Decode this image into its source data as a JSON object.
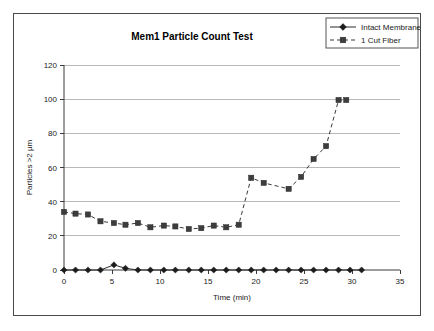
{
  "chart_data": {
    "type": "line",
    "title": "Mem1 Particle Count Test",
    "xlabel": "Time (min)",
    "ylabel": "Particles >2 µm",
    "xlim": [
      0,
      35
    ],
    "ylim": [
      0,
      120
    ],
    "xticks": [
      "0",
      "5",
      "10",
      "15",
      "20",
      "25",
      "30",
      "35"
    ],
    "yticks": [
      "0",
      "20",
      "40",
      "60",
      "80",
      "100",
      "120"
    ],
    "grid": "horizontal",
    "legend_position": "top-right",
    "series": [
      {
        "name": "Intact Membrane",
        "marker": "diamond",
        "linestyle": "solid",
        "color": "#1c1c1c",
        "x": [
          0,
          1.2,
          2.5,
          3.8,
          5.2,
          6.4,
          7.7,
          9.0,
          10.4,
          11.6,
          13.0,
          14.3,
          15.6,
          16.9,
          18.2,
          19.5,
          20.8,
          22.1,
          23.4,
          24.7,
          26.0,
          27.3,
          28.6,
          29.8,
          31.0
        ],
        "y": [
          0,
          0,
          0,
          0,
          3,
          1,
          0,
          0,
          0,
          0,
          0,
          0,
          0,
          0,
          0,
          0,
          0,
          0,
          0,
          0,
          0,
          0,
          0,
          0,
          0
        ]
      },
      {
        "name": "1 Cut Fiber",
        "marker": "square",
        "linestyle": "dashed",
        "color": "#3d3d3d",
        "x": [
          0,
          1.2,
          2.5,
          3.8,
          5.2,
          6.4,
          7.7,
          9.0,
          10.4,
          11.6,
          13.0,
          14.3,
          15.6,
          16.9,
          18.2,
          19.5,
          20.8,
          23.4,
          24.7,
          26.0,
          27.3,
          28.6,
          29.4
        ],
        "y": [
          34,
          33,
          32.5,
          28.5,
          27.5,
          26.5,
          27.5,
          25,
          26,
          25.5,
          24,
          24.5,
          26,
          25,
          26.5,
          54,
          51,
          47.5,
          54.5,
          65,
          72.5,
          99.5,
          99.5
        ]
      }
    ]
  }
}
